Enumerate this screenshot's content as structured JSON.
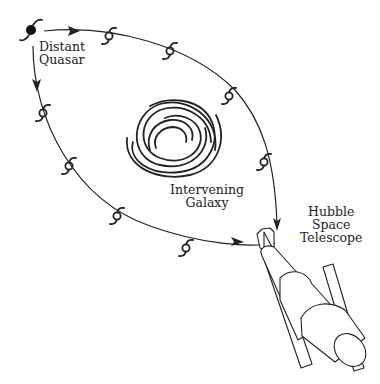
{
  "diagram": {
    "type": "gravitational-lensing",
    "labels": {
      "quasar": [
        "Distant",
        "Quasar"
      ],
      "galaxy": [
        "Intervening",
        "Galaxy"
      ],
      "telescope": [
        "Hubble",
        "Space",
        "Telescope"
      ]
    },
    "colors": {
      "ink": "#222222",
      "background": "#ffffff"
    },
    "nodes": [
      {
        "id": "quasar",
        "label": "Distant Quasar"
      },
      {
        "id": "galaxy",
        "label": "Intervening Galaxy"
      },
      {
        "id": "telescope",
        "label": "Hubble Space Telescope"
      }
    ],
    "paths": [
      {
        "from": "quasar",
        "to": "telescope",
        "route": "upper-right arc",
        "lensed_images": 5
      },
      {
        "from": "quasar",
        "to": "telescope",
        "route": "lower-left arc",
        "lensed_images": 5
      }
    ]
  }
}
